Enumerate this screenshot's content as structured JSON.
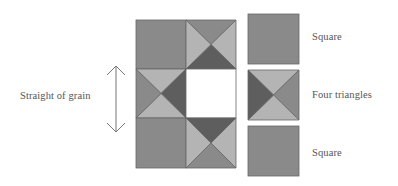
{
  "diagram": {
    "colors": {
      "medium": "#8a8a8a",
      "dark": "#5e5e5e",
      "light": "#b4b4b4",
      "blank": "#ffffff",
      "stroke": "#666666",
      "text": "#555555"
    },
    "grain_label": "Straight of grain",
    "arrow": {
      "direction": "vertical-double-headed",
      "icon": "double-arrow-vertical-icon"
    },
    "quilt_grid": {
      "rows": 3,
      "cols": 2,
      "cells": [
        {
          "row": 0,
          "col": 0,
          "type": "square"
        },
        {
          "row": 0,
          "col": 1,
          "type": "four-triangles",
          "top": "medium",
          "right": "light",
          "bottom": "dark",
          "left": "light"
        },
        {
          "row": 1,
          "col": 0,
          "type": "four-triangles",
          "top": "light",
          "right": "dark",
          "bottom": "light",
          "left": "medium"
        },
        {
          "row": 1,
          "col": 1,
          "type": "blank"
        },
        {
          "row": 2,
          "col": 0,
          "type": "square"
        },
        {
          "row": 2,
          "col": 1,
          "type": "four-triangles",
          "top": "dark",
          "right": "light",
          "bottom": "medium",
          "left": "light"
        }
      ]
    },
    "legend": [
      {
        "type": "square",
        "label": "Square"
      },
      {
        "type": "four-triangles",
        "label": "Four triangles",
        "top": "light",
        "right": "medium",
        "bottom": "light",
        "left": "dark"
      },
      {
        "type": "square",
        "label": "Square"
      }
    ]
  }
}
